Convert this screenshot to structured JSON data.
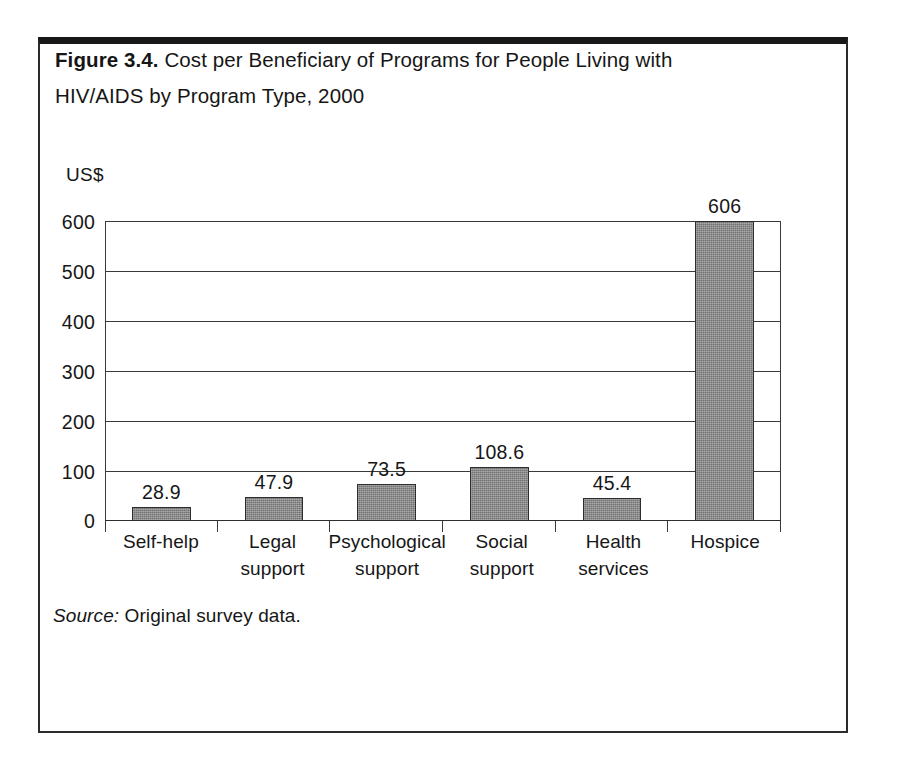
{
  "figure": {
    "label": "Figure 3.4.",
    "caption_text": " Cost per Beneficiary of Programs for People Living with HIV/AIDS by Program Type, 2000",
    "source_label": "Source:",
    "source_text": " Original survey data.",
    "frame_color": "#181818"
  },
  "chart_data": {
    "type": "bar",
    "title": "Figure 3.4. Cost per Beneficiary of Programs for People Living with HIV/AIDS by Program Type, 2000",
    "subtitle": "",
    "xlabel": "",
    "ylabel": "US$",
    "categories": [
      "Self-help",
      "Legal support",
      "Psychological support",
      "Social support",
      "Health services",
      "Hospice"
    ],
    "category_lines": [
      [
        "Self-help"
      ],
      [
        "Legal",
        "support"
      ],
      [
        "Psychological",
        "support"
      ],
      [
        "Social",
        "support"
      ],
      [
        "Health",
        "services"
      ],
      [
        "Hospice"
      ]
    ],
    "values": [
      28.9,
      47.9,
      73.5,
      108.6,
      45.4,
      606
    ],
    "value_labels": [
      "28.9",
      "47.9",
      "73.5",
      "108.6",
      "45.4",
      "606"
    ],
    "ylim": [
      0,
      600
    ],
    "yticks": [
      600,
      500,
      400,
      300,
      200,
      100,
      0
    ],
    "ytick_labels": [
      "600",
      "500",
      "400",
      "300",
      "200",
      "100",
      "0"
    ],
    "grid": true,
    "legend": "none",
    "bar_fill_color": "#8a8a8a",
    "bar_border_color": "#2e2e2e",
    "axis_color": "#3a3a3a"
  }
}
